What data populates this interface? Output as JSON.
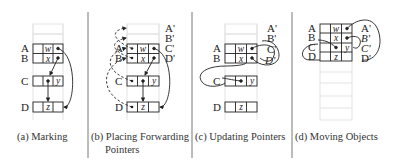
{
  "figure": {
    "panels": [
      {
        "id": "a",
        "caption": "(a) Marking",
        "row_labels": [
          "A",
          "B",
          "C",
          "D"
        ],
        "cell_values": {
          "A": "w",
          "B": "x",
          "C": "y",
          "D": "z"
        },
        "forwarding_labels": []
      },
      {
        "id": "b",
        "caption_line1": "(b) Placing Forwarding",
        "caption_line2": "Pointers",
        "row_labels": [
          "A",
          "B",
          "C",
          "D"
        ],
        "cell_values": {
          "A": "w",
          "B": "x",
          "C": "y",
          "D": "z"
        },
        "forwarding_labels": [
          "A'",
          "B'",
          "C'",
          "D'"
        ]
      },
      {
        "id": "c",
        "caption": "(c) Updating Pointers",
        "row_labels": [
          "A",
          "B",
          "C",
          "D"
        ],
        "cell_values": {
          "A": "w",
          "B": "x",
          "C": "y",
          "D": "z"
        },
        "forwarding_labels": [
          "A'",
          "B'",
          "C'",
          "D'"
        ]
      },
      {
        "id": "d",
        "caption": "(d) Moving Objects",
        "row_labels": [
          "A",
          "B",
          "C",
          "D"
        ],
        "cell_values": {
          "A": "w",
          "B": "x",
          "C": "y",
          "D": "z"
        },
        "forwarding_labels": [
          "A'",
          "B'",
          "C'",
          "D'"
        ]
      }
    ]
  },
  "colors": {
    "line": "#222222",
    "empty_cell": "#e6e6e6",
    "divider": "#555555"
  }
}
